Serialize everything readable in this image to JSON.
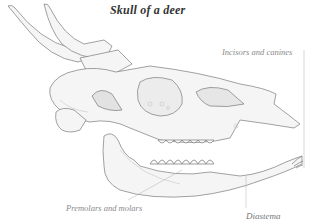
{
  "figure": {
    "title": "Skull of a deer",
    "labels": {
      "incisors": "Incisors and canines",
      "premolars": "Premolars and molars",
      "diastema": "Diastema"
    }
  },
  "colors": {
    "line": "#7a7a7a",
    "fill": "#f4f4f4",
    "shade": "#d9d9d9",
    "label": "#8a8a8a",
    "title": "#333333"
  }
}
